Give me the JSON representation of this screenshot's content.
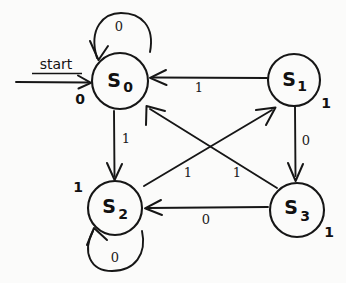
{
  "diagram": {
    "kind": "finite-state-machine",
    "start_label": "start",
    "ink_color": "#161616",
    "background_color": "#fbfbfa",
    "states": [
      {
        "id": "s0",
        "name": "S",
        "subscript": "0",
        "output": "0",
        "cx": 120,
        "cy": 81,
        "r": 28,
        "output_x": 80,
        "output_y": 104
      },
      {
        "id": "s1",
        "name": "S",
        "subscript": "1",
        "output": "1",
        "cx": 294,
        "cy": 80,
        "r": 26,
        "output_x": 326,
        "output_y": 108
      },
      {
        "id": "s2",
        "name": "S",
        "subscript": "2",
        "output": "1",
        "cx": 115,
        "cy": 208,
        "r": 27,
        "output_x": 78,
        "output_y": 192
      },
      {
        "id": "s3",
        "name": "S",
        "subscript": "3",
        "output": "1",
        "cx": 297,
        "cy": 210,
        "r": 27,
        "output_x": 329,
        "output_y": 237
      }
    ],
    "transitions": [
      {
        "id": "s0-s0",
        "from": "s0",
        "to": "s0",
        "input": "0",
        "label_x": 119,
        "label_y": 31,
        "kind": "self-loop-top"
      },
      {
        "id": "s1-s0",
        "from": "s1",
        "to": "s0",
        "input": "1",
        "label_x": 199,
        "label_y": 92,
        "kind": "horizontal"
      },
      {
        "id": "s0-s2",
        "from": "s0",
        "to": "s2",
        "input": "1",
        "label_x": 126,
        "label_y": 143,
        "kind": "vertical"
      },
      {
        "id": "s1-s3",
        "from": "s1",
        "to": "s3",
        "input": "0",
        "label_x": 306,
        "label_y": 145,
        "kind": "vertical"
      },
      {
        "id": "s2-s1",
        "from": "s2",
        "to": "s1",
        "input": "1",
        "label_x": 237,
        "label_y": 177,
        "kind": "diagonal"
      },
      {
        "id": "s3-s0",
        "from": "s3",
        "to": "s0",
        "input": "1",
        "label_x": 188,
        "label_y": 177,
        "kind": "diagonal"
      },
      {
        "id": "s3-s2",
        "from": "s3",
        "to": "s2",
        "input": "0",
        "label_x": 206,
        "label_y": 224,
        "kind": "horizontal"
      },
      {
        "id": "s2-s2",
        "from": "s2",
        "to": "s2",
        "input": "0",
        "label_x": 115,
        "label_y": 262,
        "kind": "self-loop-bottom"
      }
    ]
  }
}
